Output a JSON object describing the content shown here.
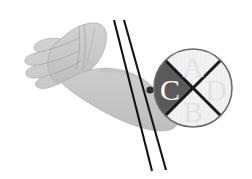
{
  "figure": {
    "background_color": "#ffffff"
  },
  "anatomy": {
    "arm_label": "forearm",
    "hand_label": "hand",
    "skin_color": "#c9c9c9",
    "skin_shadow_color": "#bcbcbc",
    "outline_color": "#a8a8a8"
  },
  "needles": {
    "count": 2,
    "color": "#141414",
    "label_1": "needle-1",
    "label_2": "needle-2"
  },
  "marker_dot": {
    "label": "entry-point-dot",
    "color": "#2b2b2b"
  },
  "quadrant_circle": {
    "label": "quadrant-circle",
    "outline_color": "#6b6b6b",
    "light_fill": "#f2f2f2",
    "dark_fill": "#5a5a5a",
    "divider_color": "#1a1a1a",
    "quadrants": [
      {
        "position": "top",
        "label": "A",
        "fill": "#f2f2f2",
        "text_color": "#e2e2e2"
      },
      {
        "position": "right",
        "label": "D",
        "fill": "#f2f2f2",
        "text_color": "#e2e2e2"
      },
      {
        "position": "bottom",
        "label": "B",
        "fill": "#f2f2f2",
        "text_color": "#e2e2e2"
      },
      {
        "position": "left",
        "label": "C",
        "fill": "#5a5a5a",
        "text_color": "#ffffff"
      }
    ]
  }
}
